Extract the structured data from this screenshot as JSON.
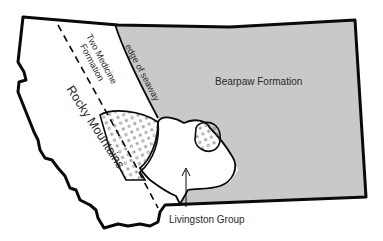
{
  "map": {
    "region": "Montana",
    "colors": {
      "background": "#ffffff",
      "seaway_fill": "#c9c9c9",
      "outline": "#0a0a0a",
      "text": "#2a2a2a",
      "dots": "#555555"
    },
    "labels": {
      "bearpaw": "Bearpaw Formation",
      "two_medicine_line1": "Two Medicine",
      "two_medicine_line2": "Formation",
      "edge_of_seaway": "edge of seaway",
      "rocky_mountains": "Rocky Mountains",
      "livingston": "Livingston Group"
    }
  }
}
